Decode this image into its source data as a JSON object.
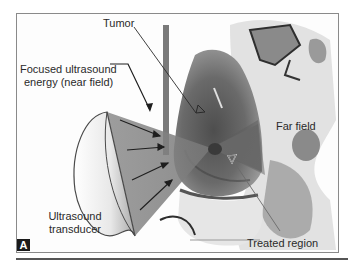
{
  "figure": {
    "panel_letter": "A",
    "labels": {
      "tumor": "Tumor",
      "focused_energy_line1": "Focused ultrasound",
      "focused_energy_line2": "energy (near field)",
      "far_field": "Far field",
      "transducer_line1": "Ultrasound",
      "transducer_line2": "transducer",
      "treated_region": "Treated region"
    },
    "colors": {
      "cone_fill": "#7a7a7a",
      "tissue_dark": "#5a5a5a",
      "tissue_light": "#b8b8b8",
      "frame_border": "#8a8a8a",
      "text": "#2a2a2a"
    }
  }
}
